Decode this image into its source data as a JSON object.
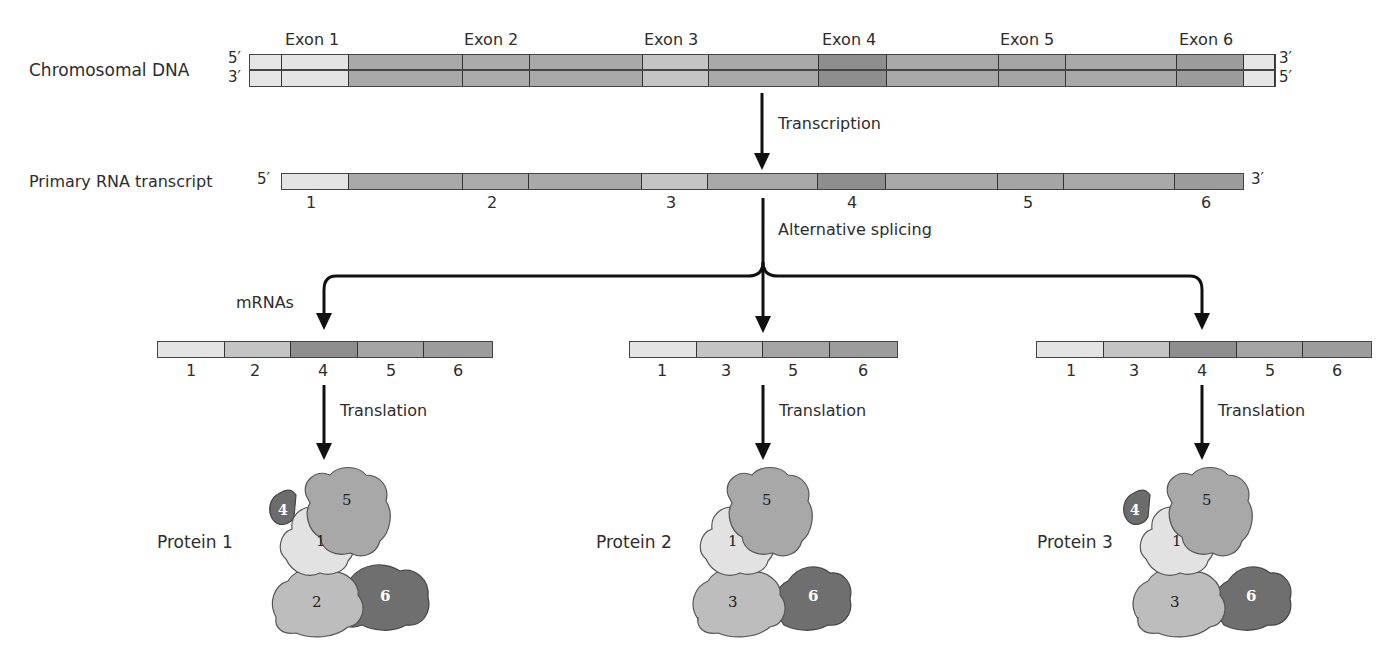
{
  "dna": {
    "label": "Chromosomal DNA",
    "top_left_end": "5′",
    "bottom_left_end": "3′",
    "top_right_end": "3′",
    "bottom_right_end": "5′",
    "exon_labels": [
      "Exon 1",
      "Exon 2",
      "Exon 3",
      "Exon 4",
      "Exon 5",
      "Exon 6"
    ]
  },
  "steps": {
    "transcription": "Transcription",
    "splicing": "Alternative splicing",
    "translation": "Translation"
  },
  "rna": {
    "label": "Primary RNA transcript",
    "left_end": "5′",
    "right_end": "3′",
    "exon_numbers": [
      "1",
      "2",
      "3",
      "4",
      "5",
      "6"
    ]
  },
  "mrnas": {
    "label": "mRNAs",
    "items": [
      {
        "exons": [
          "1",
          "2",
          "4",
          "5",
          "6"
        ]
      },
      {
        "exons": [
          "1",
          "3",
          "5",
          "6"
        ]
      },
      {
        "exons": [
          "1",
          "3",
          "4",
          "5",
          "6"
        ]
      }
    ]
  },
  "proteins": [
    {
      "label": "Protein 1",
      "domains": [
        "4",
        "5",
        "1",
        "2",
        "6"
      ]
    },
    {
      "label": "Protein 2",
      "domains": [
        "5",
        "1",
        "3",
        "6"
      ]
    },
    {
      "label": "Protein 3",
      "domains": [
        "4",
        "5",
        "1",
        "3",
        "6"
      ]
    }
  ],
  "colors": {
    "exon1": "#e4e4e4",
    "exon2": "#c4c4c4",
    "exon3": "#c4c4c4",
    "exon4": "#8e8e8e",
    "exon5": "#a5a5a5",
    "exon6": "#9c9c9c",
    "intron": "#a9a9a9",
    "arrow": "#111111"
  }
}
